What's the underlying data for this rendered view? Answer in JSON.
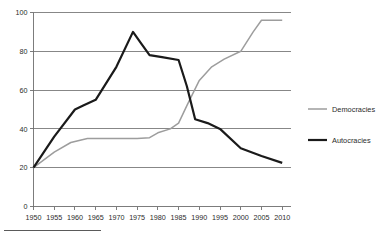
{
  "chart_data": {
    "type": "line",
    "title": "",
    "subtitle": "",
    "xlabel": "",
    "ylabel": "",
    "xlim": [
      1950,
      2012
    ],
    "ylim": [
      0,
      100
    ],
    "grid": true,
    "grid_axis": "y",
    "legend_position": "right",
    "x_tick_labels": [
      "1950",
      "1955",
      "1960",
      "1965",
      "1970",
      "1975",
      "1980",
      "1985",
      "1990",
      "1995",
      "2000",
      "2005",
      "2010"
    ],
    "x_ticks": [
      1950,
      1955,
      1960,
      1965,
      1970,
      1975,
      1980,
      1985,
      1990,
      1995,
      2000,
      2005,
      2010
    ],
    "y_tick_labels": [
      "0",
      "20",
      "40",
      "60",
      "80",
      "100"
    ],
    "y_ticks": [
      0,
      20,
      40,
      60,
      80,
      100
    ],
    "series": [
      {
        "name": "Democracies",
        "color": "#9d9d9d",
        "stroke_width": 1.5,
        "x": [
          1950,
          1955,
          1959,
          1963,
          1970,
          1975,
          1978,
          1980,
          1983,
          1985,
          1987,
          1990,
          1993,
          1996,
          2000,
          2003,
          2005,
          2010
        ],
        "values": [
          20,
          28,
          33,
          35,
          35,
          35,
          35.5,
          38,
          40,
          43,
          52,
          65,
          72,
          76,
          80,
          90,
          96,
          96
        ]
      },
      {
        "name": "Autocracies",
        "color": "#1a1a1a",
        "stroke_width": 2.2,
        "x": [
          1950,
          1955,
          1960,
          1962,
          1965,
          1970,
          1974,
          1976,
          1978,
          1981,
          1985,
          1987,
          1989,
          1992,
          1995,
          2000,
          2005,
          2010
        ],
        "values": [
          20,
          36,
          50,
          52,
          55,
          72,
          90,
          84,
          78,
          77,
          75.5,
          62,
          45,
          43,
          40,
          30,
          26,
          22.5
        ]
      }
    ],
    "legend_entries": [
      {
        "label": "Democracies",
        "color": "#9d9d9d",
        "stroke_width": 1.5
      },
      {
        "label": "Autocracies",
        "color": "#1a1a1a",
        "stroke_width": 2.2
      }
    ]
  },
  "footnote": {
    "rule_visible": true
  }
}
